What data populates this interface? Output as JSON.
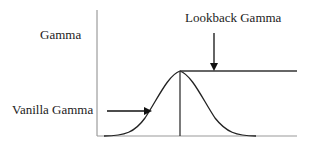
{
  "diagram": {
    "type": "gamma_comparison",
    "labels": {
      "y_axis": "Gamma",
      "lookback": "Lookback Gamma",
      "vanilla": "Vanilla Gamma"
    },
    "colors": {
      "axis": "#888888",
      "curve": "#222222",
      "arrow": "#111111",
      "text": "#222222"
    },
    "curves": [
      {
        "name": "Vanilla Gamma",
        "shape": "bell",
        "description": "Bell-shaped gamma peaking at the strike"
      },
      {
        "name": "Lookback Gamma",
        "shape": "bell-rise then flat",
        "description": "Follows vanilla rise to the peak then stays flat at peak level"
      }
    ],
    "annotations": [
      {
        "text": "Lookback Gamma",
        "arrow": "down",
        "target": "flat segment"
      },
      {
        "text": "Vanilla Gamma",
        "arrow": "right",
        "target": "rising bell side"
      }
    ]
  }
}
